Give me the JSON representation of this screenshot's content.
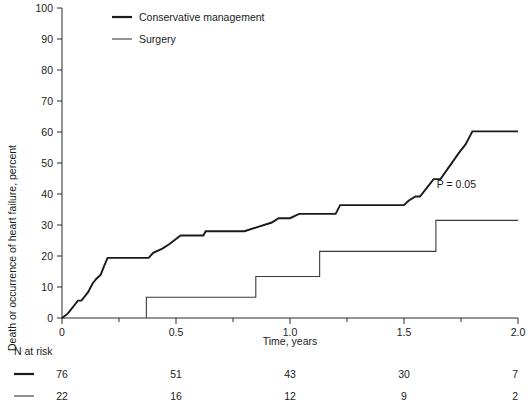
{
  "chart_data": {
    "type": "line",
    "subtype": "kaplan-meier-step",
    "title": "",
    "xlabel": "Time, years",
    "ylabel": "Death or occurrence of heart failure, percent",
    "xlim": [
      0,
      2.0
    ],
    "ylim": [
      0,
      100
    ],
    "grid": false,
    "x_ticks_major": [
      0,
      0.5,
      1.0,
      1.5,
      2.0
    ],
    "x_tick_labels": [
      "0",
      "0.5",
      "1.0",
      "1.5",
      "2.0"
    ],
    "x_ticks_minor": [
      0.25,
      0.75,
      1.25,
      1.75
    ],
    "y_ticks": [
      0,
      10,
      20,
      30,
      40,
      50,
      60,
      70,
      80,
      90,
      100
    ],
    "y_tick_labels": [
      "0",
      "10",
      "20",
      "30",
      "40",
      "50",
      "60",
      "70",
      "80",
      "90",
      "100"
    ],
    "legend_position": "top-left-inside",
    "annotations": [
      {
        "text": "P = 0.05",
        "x": 1.73,
        "y": 42
      }
    ],
    "series": [
      {
        "name": "Conservative management",
        "style": "thick",
        "color": "#1a1a1a",
        "points": [
          [
            0.0,
            0.0
          ],
          [
            0.025,
            1.4
          ],
          [
            0.04,
            2.8
          ],
          [
            0.055,
            4.2
          ],
          [
            0.07,
            5.6
          ],
          [
            0.085,
            5.6
          ],
          [
            0.1,
            7.0
          ],
          [
            0.115,
            8.4
          ],
          [
            0.135,
            11.2
          ],
          [
            0.15,
            12.6
          ],
          [
            0.17,
            14.0
          ],
          [
            0.185,
            16.8
          ],
          [
            0.2,
            19.4
          ],
          [
            0.205,
            19.4
          ],
          [
            0.38,
            19.4
          ],
          [
            0.4,
            21.0
          ],
          [
            0.44,
            22.4
          ],
          [
            0.47,
            23.8
          ],
          [
            0.52,
            26.6
          ],
          [
            0.62,
            26.6
          ],
          [
            0.63,
            28.0
          ],
          [
            0.8,
            28.0
          ],
          [
            0.86,
            29.4
          ],
          [
            0.92,
            30.8
          ],
          [
            0.95,
            32.2
          ],
          [
            1.0,
            32.2
          ],
          [
            1.04,
            33.6
          ],
          [
            1.2,
            33.6
          ],
          [
            1.22,
            36.4
          ],
          [
            1.5,
            36.4
          ],
          [
            1.52,
            37.8
          ],
          [
            1.55,
            39.2
          ],
          [
            1.57,
            39.2
          ],
          [
            1.6,
            42.0
          ],
          [
            1.63,
            44.8
          ],
          [
            1.66,
            44.8
          ],
          [
            1.7,
            49.0
          ],
          [
            1.74,
            53.2
          ],
          [
            1.77,
            56.0
          ],
          [
            1.8,
            60.2
          ],
          [
            2.0,
            60.2
          ]
        ]
      },
      {
        "name": "Surgery",
        "style": "thin",
        "color": "#3a3a3a",
        "points": [
          [
            0.37,
            0.0
          ],
          [
            0.37,
            6.7
          ],
          [
            0.85,
            6.7
          ],
          [
            0.85,
            13.4
          ],
          [
            1.13,
            13.4
          ],
          [
            1.13,
            21.5
          ],
          [
            1.64,
            21.5
          ],
          [
            1.64,
            31.5
          ],
          [
            2.0,
            31.5
          ]
        ]
      }
    ],
    "risk_table": {
      "title": "N at risk",
      "times": [
        0,
        0.5,
        1.0,
        1.5,
        2.0
      ],
      "rows": [
        {
          "series": "Conservative management",
          "style": "thick",
          "counts": [
            "76",
            "51",
            "43",
            "30",
            "7"
          ]
        },
        {
          "series": "Surgery",
          "style": "thin",
          "counts": [
            "22",
            "16",
            "12",
            "9",
            "2"
          ]
        }
      ]
    }
  },
  "legend": {
    "items": [
      {
        "label": "Conservative management",
        "style": "thick"
      },
      {
        "label": "Surgery",
        "style": "thin"
      }
    ]
  }
}
